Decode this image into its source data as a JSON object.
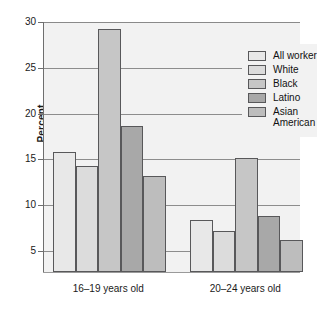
{
  "chart_data": {
    "type": "bar",
    "title": "",
    "subtitle": "",
    "xlabel": "",
    "ylabel": "Percent",
    "categories": [
      "16–19 years old",
      "20–24 years old"
    ],
    "series": [
      {
        "name": "All workers",
        "values": [
          15.8,
          8.4
        ],
        "color": "#e8e8e8"
      },
      {
        "name": "White",
        "values": [
          14.3,
          7.2
        ],
        "color": "#dcdcdc"
      },
      {
        "name": "Black",
        "values": [
          29.2,
          15.1
        ],
        "color": "#c6c6c6"
      },
      {
        "name": "Latino",
        "values": [
          18.6,
          8.8
        ],
        "color": "#a8a8a8"
      },
      {
        "name": "Asian\nAmerican",
        "values": [
          13.2,
          6.2
        ],
        "color": "#bdbdbd"
      }
    ],
    "ylim": [
      2.7,
      30
    ],
    "yticks": [
      5,
      10,
      15,
      20,
      25,
      30
    ],
    "ytick_labels": [
      "5",
      "10",
      "15",
      "20",
      "25",
      "30"
    ],
    "grid": true,
    "legend_position": "top-right",
    "plot_background": "#f2f2f2",
    "bar_outline_color": "#58585a",
    "gridline_color": "#8d8d8d"
  },
  "legend": {
    "entries": [
      {
        "label": "All workers"
      },
      {
        "label": "White"
      },
      {
        "label": "Black"
      },
      {
        "label": "Latino"
      },
      {
        "label": "Asian\nAmerican"
      }
    ]
  }
}
